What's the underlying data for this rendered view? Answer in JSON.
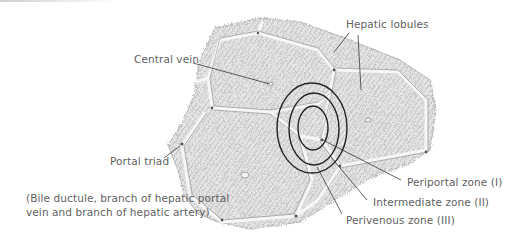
{
  "diagram": {
    "colors": {
      "label_text": "#5f5f5f",
      "leader_line": "#3a3a3a",
      "zone_ellipse": "#222222",
      "tissue_fill": "#d9d9d9",
      "tissue_texture": "#9a9a9a",
      "lobule_border": "#f4f4f4"
    },
    "labels": {
      "central_vein": "Central vein",
      "hepatic_lobules": "Hepatic lobules",
      "portal_triad": "Portal triad",
      "portal_triad_detail": "(Bile ductule, branch of hepatic portal\nvein and branch of hepatic artery)",
      "periportal_zone": "Periportal zone (I)",
      "intermediate_zone": "Intermediate zone (II)",
      "perivenous_zone": "Perivenous zone (III)"
    },
    "zones": [
      {
        "name": "Perivenous zone (III)",
        "ring": "inner",
        "cx": 313,
        "cy": 128,
        "rx": 15,
        "ry": 22
      },
      {
        "name": "Intermediate zone (II)",
        "ring": "middle",
        "cx": 314,
        "cy": 129,
        "rx": 25,
        "ry": 36
      },
      {
        "name": "Periportal zone (I)",
        "ring": "outer",
        "cx": 312,
        "cy": 128,
        "rx": 35,
        "ry": 45
      }
    ]
  }
}
